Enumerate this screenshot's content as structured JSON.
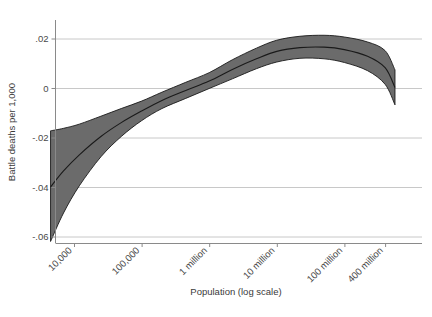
{
  "chart_data": {
    "type": "line",
    "title": "",
    "subtitle": "",
    "xlabel": "Population (log scale)",
    "ylabel": "Battle deaths per 1,000",
    "grid": "horizontal",
    "legend": "none",
    "x_scale": "log10",
    "x_tick_labels": [
      "10,000",
      "100,000",
      "1 million",
      "10 million",
      "100 million",
      "400 million"
    ],
    "x_tick_values": [
      10000,
      100000,
      1000000,
      10000000,
      100000000,
      400000000
    ],
    "xlim": [
      4000,
      600000000
    ],
    "y_tick_labels": [
      ".02",
      "0",
      "-.02",
      "-.04",
      "-.06"
    ],
    "y_tick_values": [
      0.02,
      0,
      -0.02,
      -0.04,
      -0.06
    ],
    "ylim": [
      -0.065,
      0.028
    ],
    "band_label": "confidence interval",
    "band_color": "#6b6b6b",
    "line_color": "#1a1a1a",
    "grid_color": "#c8c8c8",
    "axis_color": "#808080",
    "series": [
      {
        "name": "fitted",
        "x": [
          4500,
          7000,
          12000,
          25000,
          50000,
          100000,
          200000,
          450000,
          1000000,
          2200000,
          5000000,
          10000000,
          22000000,
          50000000,
          100000000,
          220000000,
          400000000,
          560000000
        ],
        "values": [
          -0.04,
          -0.0335,
          -0.027,
          -0.0196,
          -0.014,
          -0.0093,
          -0.005,
          -0.001,
          0.0028,
          0.0075,
          0.0118,
          0.0148,
          0.0163,
          0.0165,
          0.0155,
          0.0128,
          0.0082,
          0.0002
        ],
        "lower": [
          -0.062,
          -0.0505,
          -0.0395,
          -0.0278,
          -0.0196,
          -0.0132,
          -0.0083,
          -0.0042,
          -0.0002,
          0.0037,
          0.0078,
          0.0105,
          0.012,
          0.0118,
          0.0103,
          0.007,
          0.0015,
          -0.0068
        ],
        "upper": [
          -0.0173,
          -0.0163,
          -0.0146,
          -0.0114,
          -0.0083,
          -0.0053,
          -0.0017,
          0.0023,
          0.0062,
          0.0114,
          0.0161,
          0.0193,
          0.0209,
          0.0213,
          0.0206,
          0.0186,
          0.0151,
          0.0073
        ]
      }
    ]
  },
  "axes": {
    "y_title": "Battle deaths per 1,000",
    "x_title": "Population (log scale)"
  }
}
